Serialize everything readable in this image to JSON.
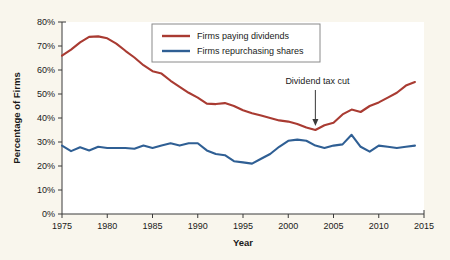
{
  "figure": {
    "background_color": "#f9f6ed",
    "plot_background_color": "#ffffff"
  },
  "chart_data": {
    "type": "line",
    "title": "",
    "xlabel": "Year",
    "ylabel": "Percentage of Firms",
    "xlim": [
      1975,
      2015
    ],
    "ylim": [
      0,
      80
    ],
    "xticks": [
      "1975",
      "1980",
      "1985",
      "1990",
      "1995",
      "2000",
      "2005",
      "2010",
      "2015"
    ],
    "xtick_values": [
      1975,
      1980,
      1985,
      1990,
      1995,
      2000,
      2005,
      2010,
      2015
    ],
    "yticks": [
      "0%",
      "10%",
      "20%",
      "30%",
      "40%",
      "50%",
      "60%",
      "70%",
      "80%"
    ],
    "ytick_values": [
      0,
      10,
      20,
      30,
      40,
      50,
      60,
      70,
      80
    ],
    "grid": false,
    "legend_position": "top-center",
    "x": [
      1975,
      1976,
      1977,
      1978,
      1979,
      1980,
      1981,
      1982,
      1983,
      1984,
      1985,
      1986,
      1987,
      1988,
      1989,
      1990,
      1991,
      1992,
      1993,
      1994,
      1995,
      1996,
      1997,
      1998,
      1999,
      2000,
      2001,
      2002,
      2003,
      2004,
      2005,
      2006,
      2007,
      2008,
      2009,
      2010,
      2011,
      2012,
      2013,
      2014
    ],
    "series": [
      {
        "name": "Firms paying dividends",
        "color": "#a93b32",
        "values": [
          66.0,
          68.5,
          71.5,
          73.8,
          74.0,
          73.2,
          71.0,
          68.0,
          65.2,
          62.0,
          59.5,
          58.5,
          55.5,
          53.0,
          50.5,
          48.5,
          46.0,
          45.8,
          46.2,
          45.0,
          43.2,
          42.0,
          41.0,
          40.0,
          39.0,
          38.5,
          37.5,
          36.0,
          35.0,
          37.0,
          38.0,
          41.5,
          43.5,
          42.5,
          45.0,
          46.5,
          48.5,
          50.5,
          53.5,
          55.0
        ]
      },
      {
        "name": "Firms repurchasing shares",
        "color": "#2f5f94",
        "values": [
          28.5,
          26.2,
          27.8,
          26.5,
          28.0,
          27.5,
          27.5,
          27.5,
          27.2,
          28.5,
          27.5,
          28.5,
          29.5,
          28.5,
          29.5,
          29.5,
          26.5,
          25.0,
          24.5,
          22.0,
          21.5,
          21.0,
          23.0,
          25.0,
          28.0,
          30.5,
          31.0,
          30.5,
          28.5,
          27.5,
          28.5,
          29.0,
          33.0,
          28.0,
          26.0,
          28.5,
          28.0,
          27.5,
          28.0,
          28.5
        ]
      }
    ],
    "annotations": [
      {
        "text": "Dividend tax cut",
        "x": 2003,
        "y": 35,
        "arrow": "down-arrow"
      }
    ]
  }
}
